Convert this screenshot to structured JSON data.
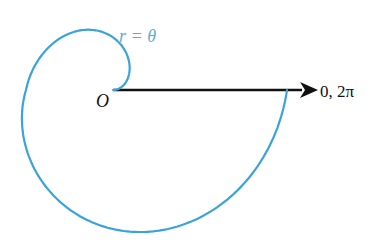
{
  "figure": {
    "curve_label": "r = θ",
    "origin_label": "O",
    "axis_label": "0, 2π"
  },
  "colors": {
    "curve": "#3aa3dc",
    "curve_label": "#5aaedc",
    "axis": "#111111",
    "background": "#ffffff"
  },
  "chart_data": {
    "type": "line",
    "equation": "r = θ",
    "theta_range": [
      0,
      6.283185307
    ],
    "origin_px": [
      113,
      90
    ],
    "annotations": [
      "r = θ",
      "O",
      "0, 2π"
    ],
    "polar_axis": {
      "direction": "0, 2π",
      "arrow": true
    },
    "grid": false
  }
}
